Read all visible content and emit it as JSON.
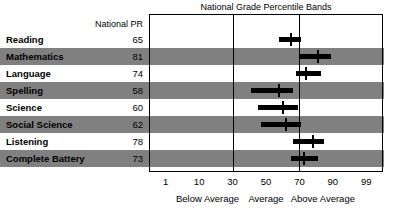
{
  "chart_data": {
    "type": "bar",
    "title": "National Grade Percentile Bands",
    "subtitle": "",
    "xlabel": "",
    "ylabel": "",
    "grid": true,
    "legend_position": "none",
    "axis_ticks": [
      {
        "label": "1",
        "value": 1
      },
      {
        "label": "10",
        "value": 10
      },
      {
        "label": "30",
        "value": 30
      },
      {
        "label": "50",
        "value": 50
      },
      {
        "label": "70",
        "value": 70
      },
      {
        "label": "90",
        "value": 90
      },
      {
        "label": "99",
        "value": 99
      }
    ],
    "gridline_values": [
      30,
      70
    ],
    "zones": [
      {
        "label": "Below Average",
        "center": 15
      },
      {
        "label": "Average",
        "center": 50
      },
      {
        "label": "Above Average",
        "center": 84
      }
    ],
    "pr_header": "National PR",
    "categories": [
      "Reading",
      "Mathematics",
      "Language",
      "Spelling",
      "Science",
      "Social Science",
      "Listening",
      "Complete Battery"
    ],
    "values": [
      65,
      81,
      74,
      58,
      60,
      62,
      78,
      73
    ],
    "series": [
      {
        "name": "National Grade Percentile Band",
        "bands": [
          {
            "category": "Reading",
            "pr": 65,
            "low": 58,
            "high": 71,
            "marker": 65
          },
          {
            "category": "Mathematics",
            "pr": 81,
            "low": 70,
            "high": 89,
            "marker": 81
          },
          {
            "category": "Language",
            "pr": 74,
            "low": 68,
            "high": 83,
            "marker": 74
          },
          {
            "category": "Spelling",
            "pr": 58,
            "low": 41,
            "high": 66,
            "marker": 58
          },
          {
            "category": "Science",
            "pr": 60,
            "low": 45,
            "high": 69,
            "marker": 60
          },
          {
            "category": "Social Science",
            "pr": 62,
            "low": 47,
            "high": 71,
            "marker": 62
          },
          {
            "category": "Listening",
            "pr": 78,
            "low": 66,
            "high": 85,
            "marker": 78
          },
          {
            "category": "Complete Battery",
            "pr": 73,
            "low": 65,
            "high": 81,
            "marker": 73
          }
        ]
      }
    ],
    "colors": {
      "band": "#000000",
      "row_shade": "#808080",
      "frame": "#000000",
      "background": "#ffffff"
    }
  }
}
